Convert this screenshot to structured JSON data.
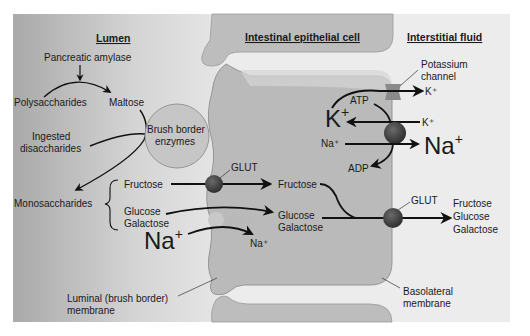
{
  "headers": {
    "lumen": "Lumen",
    "cell": "Intestinal epithelial cell",
    "interstitial": "Interstitial fluid"
  },
  "lumen": {
    "enzyme": "Pancreatic amylase",
    "polysaccharides": "Polysaccharides",
    "maltose": "Maltose",
    "ingested_1": "Ingested",
    "ingested_2": "disaccharides",
    "brush_1": "Brush border",
    "brush_2": "enzymes",
    "monosaccharides": "Monosaccharides",
    "fructose": "Fructose",
    "glucose": "Glucose",
    "galactose": "Galactose",
    "na_big": "Na",
    "na_sup": "+",
    "luminal_1": "Luminal (brush border)",
    "luminal_2": "membrane"
  },
  "cell": {
    "glut": "GLUT",
    "sglt": "SGLT",
    "fructose": "Fructose",
    "glucose": "Glucose",
    "galactose": "Galactose",
    "na_small": "Na⁺",
    "k_big": "K",
    "k_sup": "+",
    "atp": "ATP",
    "adp": "ADP",
    "na_in": "Na⁺"
  },
  "interstitial": {
    "potassium_1": "Potassium",
    "potassium_2": "channel",
    "k_out": "K⁺",
    "k_in": "K⁺",
    "na_big": "Na",
    "na_sup": "+",
    "glut": "GLUT",
    "fructose": "Fructose",
    "glucose": "Glucose",
    "galactose": "Galactose",
    "basolateral_1": "Basolateral",
    "basolateral_2": "membrane"
  },
  "colors": {
    "lumen_dark": "#a8a8a8",
    "lumen_light": "#e6e6e6",
    "cell_fill": "#b9b9b9",
    "cell_light": "#d2d2d2",
    "interstitial": "#eeeeee",
    "transporter": "#3c3c3c",
    "sglt": "#c8c8c8",
    "arrow": "#111111"
  }
}
